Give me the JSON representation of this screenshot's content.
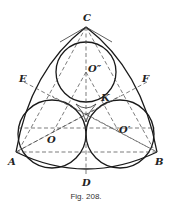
{
  "figure": {
    "caption": "Fig. 208.",
    "points": {
      "C": "C",
      "A": "A",
      "B": "B",
      "D": "D",
      "E": "E",
      "F": "F",
      "K": "K",
      "O": "O",
      "O1": "O′",
      "O2": "O″"
    }
  }
}
